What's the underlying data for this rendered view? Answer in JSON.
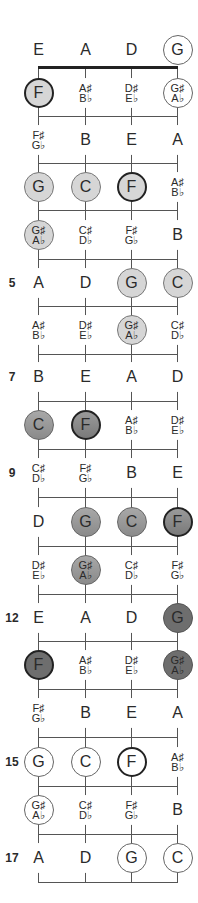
{
  "diagram": {
    "type": "fretboard",
    "strings": [
      "E",
      "A",
      "D",
      "G"
    ],
    "string_x": [
      38,
      85,
      131,
      177
    ],
    "row_y": [
      50,
      93,
      140,
      187,
      235,
      283,
      330,
      377,
      425,
      473,
      522,
      570,
      618,
      665,
      713,
      762,
      810,
      858
    ],
    "fret_line_y": [
      116,
      163,
      210,
      259,
      306,
      354,
      401,
      449,
      497,
      546,
      594,
      641,
      689,
      737,
      786,
      834,
      882
    ],
    "nut_y": 67,
    "fret_markers": [
      {
        "fret": 5,
        "label": "5"
      },
      {
        "fret": 7,
        "label": "7"
      },
      {
        "fret": 9,
        "label": "9"
      },
      {
        "fret": 12,
        "label": "12"
      },
      {
        "fret": 15,
        "label": "15"
      },
      {
        "fret": 17,
        "label": "17"
      }
    ],
    "rows": [
      [
        {
          "n": "E",
          "s": "",
          "style": "plain"
        },
        {
          "n": "A",
          "s": "",
          "style": "plain"
        },
        {
          "n": "D",
          "s": "",
          "style": "plain"
        },
        {
          "n": "G",
          "s": "",
          "style": "outline"
        }
      ],
      [
        {
          "n": "F",
          "s": "",
          "style": "light-bold"
        },
        {
          "n": "A♯",
          "s": "B♭",
          "style": "plain"
        },
        {
          "n": "D♯",
          "s": "E♭",
          "style": "plain"
        },
        {
          "n": "G♯",
          "s": "A♭",
          "style": "outline"
        }
      ],
      [
        {
          "n": "F♯",
          "s": "G♭",
          "style": "plain"
        },
        {
          "n": "B",
          "s": "",
          "style": "plain"
        },
        {
          "n": "E",
          "s": "",
          "style": "plain"
        },
        {
          "n": "A",
          "s": "",
          "style": "plain"
        }
      ],
      [
        {
          "n": "G",
          "s": "",
          "style": "light"
        },
        {
          "n": "C",
          "s": "",
          "style": "light"
        },
        {
          "n": "F",
          "s": "",
          "style": "light-bold"
        },
        {
          "n": "A♯",
          "s": "B♭",
          "style": "plain"
        }
      ],
      [
        {
          "n": "G♯",
          "s": "A♭",
          "style": "light"
        },
        {
          "n": "C♯",
          "s": "D♭",
          "style": "plain"
        },
        {
          "n": "F♯",
          "s": "G♭",
          "style": "plain"
        },
        {
          "n": "B",
          "s": "",
          "style": "plain"
        }
      ],
      [
        {
          "n": "A",
          "s": "",
          "style": "plain"
        },
        {
          "n": "D",
          "s": "",
          "style": "plain"
        },
        {
          "n": "G",
          "s": "",
          "style": "light"
        },
        {
          "n": "C",
          "s": "",
          "style": "light"
        }
      ],
      [
        {
          "n": "A♯",
          "s": "B♭",
          "style": "plain"
        },
        {
          "n": "D♯",
          "s": "E♭",
          "style": "plain"
        },
        {
          "n": "G♯",
          "s": "A♭",
          "style": "light"
        },
        {
          "n": "C♯",
          "s": "D♭",
          "style": "plain"
        }
      ],
      [
        {
          "n": "B",
          "s": "",
          "style": "plain"
        },
        {
          "n": "E",
          "s": "",
          "style": "plain"
        },
        {
          "n": "A",
          "s": "",
          "style": "plain"
        },
        {
          "n": "D",
          "s": "",
          "style": "plain"
        }
      ],
      [
        {
          "n": "C",
          "s": "",
          "style": "mid"
        },
        {
          "n": "F",
          "s": "",
          "style": "mid-bold"
        },
        {
          "n": "A♯",
          "s": "B♭",
          "style": "plain"
        },
        {
          "n": "D♯",
          "s": "E♭",
          "style": "plain"
        }
      ],
      [
        {
          "n": "C♯",
          "s": "D♭",
          "style": "plain"
        },
        {
          "n": "F♯",
          "s": "G♭",
          "style": "plain"
        },
        {
          "n": "B",
          "s": "",
          "style": "plain"
        },
        {
          "n": "E",
          "s": "",
          "style": "plain"
        }
      ],
      [
        {
          "n": "D",
          "s": "",
          "style": "plain"
        },
        {
          "n": "G",
          "s": "",
          "style": "mid"
        },
        {
          "n": "C",
          "s": "",
          "style": "mid"
        },
        {
          "n": "F",
          "s": "",
          "style": "mid-bold"
        }
      ],
      [
        {
          "n": "D♯",
          "s": "E♭",
          "style": "plain"
        },
        {
          "n": "G♯",
          "s": "A♭",
          "style": "mid"
        },
        {
          "n": "C♯",
          "s": "D♭",
          "style": "plain"
        },
        {
          "n": "F♯",
          "s": "G♭",
          "style": "plain"
        }
      ],
      [
        {
          "n": "E",
          "s": "",
          "style": "plain"
        },
        {
          "n": "A",
          "s": "",
          "style": "plain"
        },
        {
          "n": "D",
          "s": "",
          "style": "plain"
        },
        {
          "n": "G",
          "s": "",
          "style": "dark"
        }
      ],
      [
        {
          "n": "F",
          "s": "",
          "style": "dark-bold"
        },
        {
          "n": "A♯",
          "s": "B♭",
          "style": "plain"
        },
        {
          "n": "D♯",
          "s": "E♭",
          "style": "plain"
        },
        {
          "n": "G♯",
          "s": "A♭",
          "style": "dark"
        }
      ],
      [
        {
          "n": "F♯",
          "s": "G♭",
          "style": "plain"
        },
        {
          "n": "B",
          "s": "",
          "style": "plain"
        },
        {
          "n": "E",
          "s": "",
          "style": "plain"
        },
        {
          "n": "A",
          "s": "",
          "style": "plain"
        }
      ],
      [
        {
          "n": "G",
          "s": "",
          "style": "outline"
        },
        {
          "n": "C",
          "s": "",
          "style": "outline"
        },
        {
          "n": "F",
          "s": "",
          "style": "outline-bold"
        },
        {
          "n": "A♯",
          "s": "B♭",
          "style": "plain"
        }
      ],
      [
        {
          "n": "G♯",
          "s": "A♭",
          "style": "outline"
        },
        {
          "n": "C♯",
          "s": "D♭",
          "style": "plain"
        },
        {
          "n": "F♯",
          "s": "G♭",
          "style": "plain"
        },
        {
          "n": "B",
          "s": "",
          "style": "plain"
        }
      ],
      [
        {
          "n": "A",
          "s": "",
          "style": "plain"
        },
        {
          "n": "D",
          "s": "",
          "style": "plain"
        },
        {
          "n": "G",
          "s": "",
          "style": "outline"
        },
        {
          "n": "C",
          "s": "",
          "style": "outline"
        }
      ]
    ]
  }
}
